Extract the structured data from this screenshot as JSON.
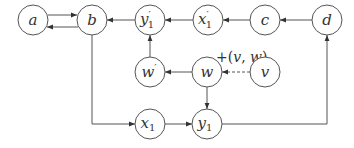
{
  "diagram": {
    "type": "directed-graph",
    "nodes": [
      {
        "id": "a",
        "label": "a",
        "sub": "",
        "prime": false,
        "x": 33,
        "y": 20
      },
      {
        "id": "b",
        "label": "b",
        "sub": "",
        "prime": false,
        "x": 92,
        "y": 20
      },
      {
        "id": "y1p",
        "label": "y",
        "sub": "1",
        "prime": true,
        "x": 150,
        "y": 20
      },
      {
        "id": "x1p",
        "label": "x",
        "sub": "1",
        "prime": true,
        "x": 208,
        "y": 20
      },
      {
        "id": "c",
        "label": "c",
        "sub": "",
        "prime": false,
        "x": 265,
        "y": 20
      },
      {
        "id": "d",
        "label": "d",
        "sub": "",
        "prime": false,
        "x": 327,
        "y": 20
      },
      {
        "id": "wp",
        "label": "w",
        "sub": "",
        "prime": true,
        "x": 150,
        "y": 72
      },
      {
        "id": "w",
        "label": "w",
        "sub": "",
        "prime": false,
        "x": 207,
        "y": 72
      },
      {
        "id": "v",
        "label": "v",
        "sub": "",
        "prime": false,
        "x": 265,
        "y": 72
      },
      {
        "id": "x1",
        "label": "x",
        "sub": "1",
        "prime": false,
        "x": 150,
        "y": 124
      },
      {
        "id": "y1",
        "label": "y",
        "sub": "1",
        "prime": false,
        "x": 207,
        "y": 124
      }
    ],
    "edges": [
      {
        "from": "a",
        "to": "b",
        "style": "solid"
      },
      {
        "from": "b",
        "to": "a",
        "style": "solid"
      },
      {
        "from": "y1p",
        "to": "b",
        "style": "solid"
      },
      {
        "from": "x1p",
        "to": "y1p",
        "style": "solid"
      },
      {
        "from": "c",
        "to": "x1p",
        "style": "solid"
      },
      {
        "from": "d",
        "to": "c",
        "style": "solid"
      },
      {
        "from": "wp",
        "to": "y1p",
        "style": "solid"
      },
      {
        "from": "w",
        "to": "wp",
        "style": "solid"
      },
      {
        "from": "v",
        "to": "w",
        "style": "dashed",
        "label": "+(v, w)"
      },
      {
        "from": "w",
        "to": "y1",
        "style": "solid"
      },
      {
        "from": "b",
        "to": "x1",
        "style": "solid",
        "route": "down-then-right"
      },
      {
        "from": "x1",
        "to": "y1",
        "style": "solid"
      },
      {
        "from": "y1",
        "to": "d",
        "style": "solid",
        "route": "right-then-up"
      }
    ],
    "edge_label": {
      "prefix": "+(",
      "var1": "v",
      "sep": ", ",
      "var2": "w",
      "suffix": ")"
    },
    "colors": {
      "stroke": "#555555",
      "text": "#333333",
      "background": "#ffffff"
    }
  }
}
